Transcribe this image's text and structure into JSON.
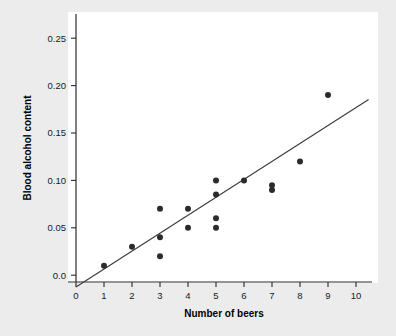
{
  "chart_data": {
    "type": "scatter",
    "title": "",
    "xlabel": "Number of beers",
    "ylabel": "Blood alcohol content",
    "xlim": [
      0,
      10.6
    ],
    "ylim": [
      -0.012,
      0.262
    ],
    "grid": false,
    "legend": null,
    "x_ticks": [
      "0",
      "1",
      "2",
      "3",
      "4",
      "5",
      "6",
      "7",
      "8",
      "9",
      "10"
    ],
    "x_tick_values": [
      0,
      1,
      2,
      3,
      4,
      5,
      6,
      7,
      8,
      9,
      10
    ],
    "y_ticks": [
      "0.0",
      "0.05",
      "0.10",
      "0.15",
      "0.20",
      "0.25"
    ],
    "y_tick_values": [
      0.0,
      0.05,
      0.1,
      0.15,
      0.2,
      0.25
    ],
    "x": [
      1,
      2,
      3,
      3,
      3,
      4,
      4,
      5,
      5,
      5,
      5,
      6,
      7,
      7,
      8,
      9
    ],
    "y": [
      0.01,
      0.03,
      0.07,
      0.04,
      0.02,
      0.07,
      0.05,
      0.1,
      0.085,
      0.06,
      0.05,
      0.1,
      0.095,
      0.09,
      0.12,
      0.19
    ],
    "points": [
      {
        "x": 1,
        "y": 0.01
      },
      {
        "x": 2,
        "y": 0.03
      },
      {
        "x": 3,
        "y": 0.07
      },
      {
        "x": 3,
        "y": 0.04
      },
      {
        "x": 3,
        "y": 0.02
      },
      {
        "x": 4,
        "y": 0.07
      },
      {
        "x": 4,
        "y": 0.05
      },
      {
        "x": 5,
        "y": 0.1
      },
      {
        "x": 5,
        "y": 0.085
      },
      {
        "x": 5,
        "y": 0.06
      },
      {
        "x": 5,
        "y": 0.05
      },
      {
        "x": 6,
        "y": 0.1
      },
      {
        "x": 7,
        "y": 0.095
      },
      {
        "x": 7,
        "y": 0.09
      },
      {
        "x": 8,
        "y": 0.12
      },
      {
        "x": 9,
        "y": 0.19
      }
    ],
    "fit_line": {
      "type": "linear-regression",
      "x_start": 0.0,
      "y_start": -0.0125,
      "x_end": 10.45,
      "y_end": 0.1853,
      "slope": 0.018971,
      "intercept": -0.0125
    },
    "marker": {
      "shape": "circle",
      "size_px": 3.0,
      "color": "#2b2b2b"
    },
    "colors": {
      "figure_background": "#ececec",
      "plot_background": "#ffffff",
      "axis": "#2a2a2a",
      "point": "#2b2b2b",
      "line": "#3b3b3b",
      "text": "#000000"
    }
  }
}
